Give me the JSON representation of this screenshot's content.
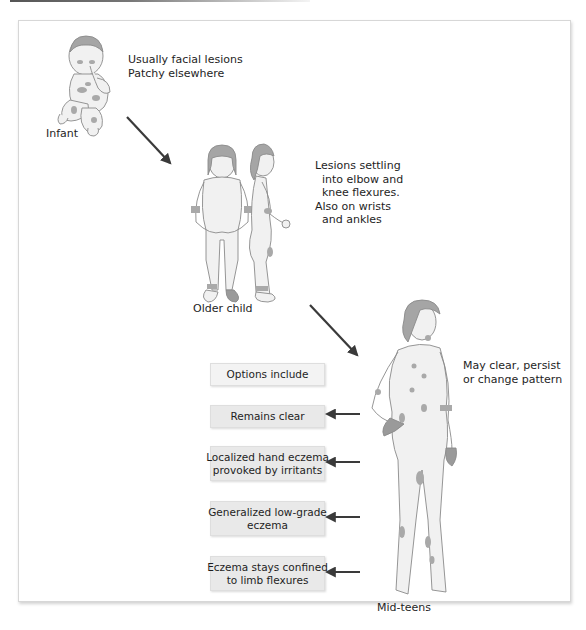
{
  "figure": {
    "title_rule": "decorative top rule",
    "stages": [
      {
        "name": "Infant",
        "description": "Usually facial lesions\nPatchy elsewhere"
      },
      {
        "name": "Older child",
        "description": "Lesions settling\n  into elbow and\n  knee flexures.\nAlso on wrists\n  and ankles"
      },
      {
        "name": "Mid-teens",
        "description": "May clear, persist\nor change pattern"
      }
    ],
    "options": {
      "header": "Options include",
      "items": [
        "Remains clear",
        "Localized hand eczema\nprovoked by irritants",
        "Generalized low-grade\neczema",
        "Eczema stays confined\nto limb flexures"
      ]
    },
    "colors": {
      "skin": "#f1f1f1",
      "outline": "#8a8a8a",
      "hair": "#9a9a9a",
      "lesion": "#a9a9a9",
      "arrow": "#3a3a3a",
      "box": "#e9e9e9"
    }
  }
}
